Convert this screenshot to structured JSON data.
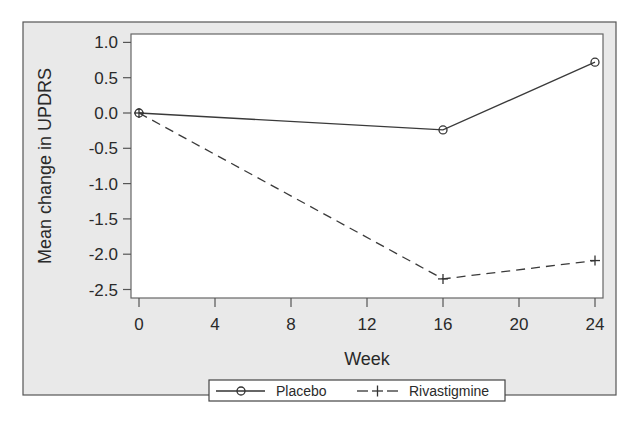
{
  "chart_data": {
    "type": "line",
    "title": "",
    "xlabel": "Week",
    "ylabel": "Mean change in UPDRS",
    "x": [
      0,
      16,
      24
    ],
    "xticks": [
      0,
      4,
      8,
      12,
      16,
      20,
      24
    ],
    "xtick_labels": [
      "0",
      "4",
      "8",
      "12",
      "16",
      "20",
      "24"
    ],
    "yticks": [
      1.0,
      0.5,
      0.0,
      -0.5,
      -1.0,
      -1.5,
      -2.0,
      -2.5
    ],
    "ytick_labels": [
      "1.0",
      "0.5",
      "0.0",
      "-0.5",
      "-1.0",
      "-1.5",
      "-2.0",
      "-2.5"
    ],
    "xlim": [
      0,
      24
    ],
    "ylim": [
      -2.6,
      1.1
    ],
    "grid": false,
    "legend_position": "bottom",
    "series": [
      {
        "name": "Placebo",
        "marker": "circle",
        "line_style": "solid",
        "values": [
          0.0,
          -0.24,
          0.72
        ]
      },
      {
        "name": "Rivastigmine",
        "marker": "plus",
        "line_style": "dashed",
        "values": [
          0.0,
          -2.35,
          -2.09
        ]
      }
    ],
    "colors": {
      "background": "#e9e9e9",
      "plot_area": "#ffffff",
      "line": "#3a3a3a"
    }
  },
  "legend": {
    "items": [
      {
        "label": "Placebo",
        "symbol": "—o—"
      },
      {
        "label": "Rivastigmine",
        "symbol": "– + –"
      }
    ]
  }
}
